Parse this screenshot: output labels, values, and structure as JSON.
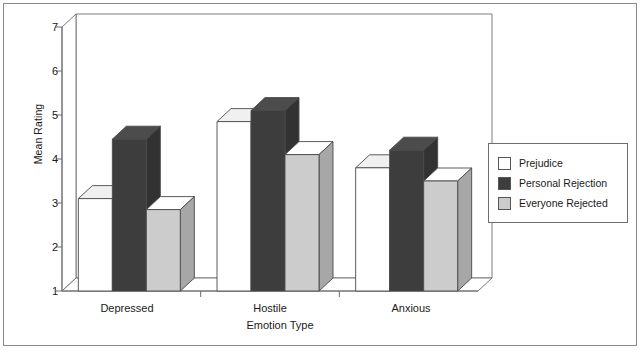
{
  "chart_data": {
    "type": "bar",
    "title": "",
    "subtitle": "",
    "xlabel": "Emotion Type",
    "ylabel": "Mean Rating",
    "categories": [
      "Depressed",
      "Hostile",
      "Anxious"
    ],
    "series": [
      {
        "name": "Prejudice",
        "color": "#ffffff",
        "values": [
          3.1,
          4.85,
          3.8
        ]
      },
      {
        "name": "Personal Rejection",
        "color": "#3d3d3d",
        "values": [
          4.45,
          5.1,
          4.2
        ]
      },
      {
        "name": "Everyone Rejected",
        "color": "#cccccc",
        "values": [
          2.85,
          4.1,
          3.5
        ]
      }
    ],
    "ylim": [
      1,
      7
    ],
    "yticks": [
      1,
      2,
      3,
      4,
      5,
      6,
      7
    ],
    "ytick_labels": [
      "1",
      "2",
      "3",
      "4",
      "5",
      "6",
      "7"
    ],
    "grid": false,
    "legend_position": "right",
    "style": "3d-bars"
  },
  "axes": {
    "y_title": "Mean Rating",
    "x_title": "Emotion Type",
    "tick_1": "1",
    "tick_2": "2",
    "tick_3": "3",
    "tick_4": "4",
    "tick_5": "5",
    "tick_6": "6",
    "tick_7": "7",
    "cat_0": "Depressed",
    "cat_1": "Hostile",
    "cat_2": "Anxious"
  },
  "legend": {
    "items": [
      {
        "label": "Prejudice"
      },
      {
        "label": "Personal Rejection"
      },
      {
        "label": "Everyone Rejected"
      }
    ]
  },
  "colors": {
    "series_prejudice": "#ffffff",
    "series_personal_rejection": "#3d3d3d",
    "series_everyone_rejected": "#cccccc",
    "axis": "#6e6e6e",
    "frame": "#8a8a8a",
    "text": "#1a1a1a"
  }
}
